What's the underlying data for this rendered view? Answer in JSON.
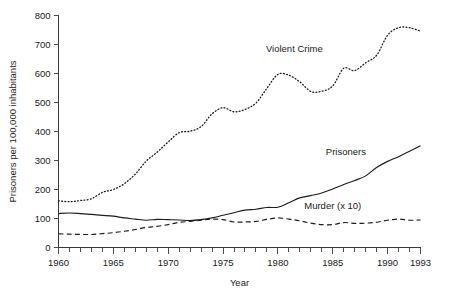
{
  "chart_data": {
    "type": "line",
    "title": "",
    "xlabel": "Year",
    "ylabel": "Prisoners per 100,000 inhabitants",
    "xlim": [
      1960,
      1993
    ],
    "ylim": [
      0,
      800
    ],
    "grid": false,
    "legend_position": "inline-annotations",
    "x_tick_labels": [
      "1960",
      "1965",
      "1970",
      "1975",
      "1980",
      "1985",
      "1990",
      "1993"
    ],
    "x_tick_values": [
      1960,
      1965,
      1970,
      1975,
      1980,
      1985,
      1990,
      1993
    ],
    "x_minor_ticks_every": 1,
    "y_tick_labels": [
      "0",
      "100",
      "200",
      "300",
      "400",
      "500",
      "600",
      "700",
      "800"
    ],
    "y_tick_values": [
      0,
      100,
      200,
      300,
      400,
      500,
      600,
      700,
      800
    ],
    "x": [
      1960,
      1961,
      1962,
      1963,
      1964,
      1965,
      1966,
      1967,
      1968,
      1969,
      1970,
      1971,
      1972,
      1973,
      1974,
      1975,
      1976,
      1977,
      1978,
      1979,
      1980,
      1981,
      1982,
      1983,
      1984,
      1985,
      1986,
      1987,
      1988,
      1989,
      1990,
      1991,
      1992,
      1993
    ],
    "series": [
      {
        "name": "Violent Crime",
        "style": "dotted",
        "label": "Violent Crime",
        "label_x": 1981.5,
        "label_y": 675,
        "values": [
          161,
          158,
          162,
          168,
          190,
          200,
          220,
          253,
          298,
          329,
          364,
          396,
          401,
          417,
          461,
          482,
          468,
          476,
          498,
          549,
          597,
          594,
          571,
          538,
          539,
          557,
          618,
          610,
          637,
          663,
          732,
          758,
          758,
          746
        ]
      },
      {
        "name": "Prisoners",
        "style": "solid",
        "label": "Prisoners",
        "label_x": 1986.2,
        "label_y": 318,
        "values": [
          117,
          119,
          117,
          114,
          111,
          108,
          102,
          98,
          94,
          97,
          96,
          95,
          93,
          96,
          102,
          111,
          120,
          129,
          132,
          138,
          139,
          154,
          171,
          179,
          188,
          202,
          217,
          231,
          247,
          276,
          297,
          313,
          332,
          351
        ]
      },
      {
        "name": "Murder (x 10)",
        "style": "dashed",
        "label": "Murder (x 10)",
        "label_x": 1985.0,
        "label_y": 133,
        "values": [
          47,
          46,
          45,
          45,
          48,
          51,
          56,
          62,
          69,
          73,
          79,
          87,
          90,
          94,
          98,
          96,
          88,
          88,
          90,
          97,
          102,
          98,
          92,
          84,
          79,
          79,
          86,
          83,
          84,
          87,
          94,
          98,
          94,
          95
        ]
      }
    ]
  },
  "axes": {
    "x_axis_title": "Year",
    "y_axis_title": "Prisoners per 100,000 inhabitants"
  }
}
